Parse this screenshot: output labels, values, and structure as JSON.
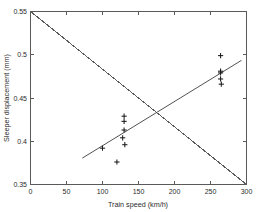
{
  "chart_data": {
    "type": "scatter",
    "title": "",
    "xlabel": "Train speed (km/h)",
    "ylabel": "Sleeper displacement (mm)",
    "xlim": [
      0,
      300
    ],
    "ylim": [
      0.35,
      0.55
    ],
    "xticks": [
      0,
      50,
      100,
      150,
      200,
      250,
      300
    ],
    "xticklabels": [
      "0",
      "50",
      "100",
      "150",
      "200",
      "250",
      "300"
    ],
    "yticks": [
      0.35,
      0.4,
      0.45,
      0.5,
      0.55
    ],
    "yticklabels": [
      "0.35",
      "0.4",
      "0.45",
      "0.5",
      "0.55"
    ],
    "grid": false,
    "legend": null,
    "marker_style": "plus",
    "marker_color": "#1a1a1a",
    "line_color": "#3d3d3d",
    "frame_color": "#5a5a5a",
    "points": [
      {
        "x": 100,
        "y": 0.392
      },
      {
        "x": 120,
        "y": 0.376
      },
      {
        "x": 128,
        "y": 0.404
      },
      {
        "x": 130,
        "y": 0.413
      },
      {
        "x": 130,
        "y": 0.423
      },
      {
        "x": 130,
        "y": 0.429
      },
      {
        "x": 131,
        "y": 0.396
      },
      {
        "x": 264,
        "y": 0.499
      },
      {
        "x": 264,
        "y": 0.481
      },
      {
        "x": 264,
        "y": 0.479
      },
      {
        "x": 264,
        "y": 0.472
      },
      {
        "x": 265,
        "y": 0.466
      }
    ],
    "fit_line": {
      "name": "linear fit",
      "x": [
        72,
        293
      ],
      "y": [
        0.3805,
        0.4935
      ]
    }
  },
  "figure": {
    "background": "#ffffff"
  }
}
